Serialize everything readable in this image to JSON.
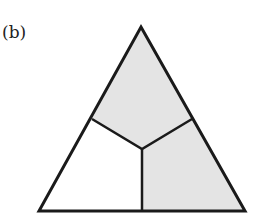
{
  "panel_label": "(b)",
  "colors": {
    "stroke": "#1a1a1a",
    "shaded_fill": "#e4e4e4",
    "unshaded_fill": "#ffffff"
  },
  "diagram": {
    "shape": "triangle",
    "regions": [
      {
        "name": "top",
        "shaded": true
      },
      {
        "name": "bottom-right",
        "shaded": true
      },
      {
        "name": "bottom-left",
        "shaded": false
      }
    ]
  }
}
